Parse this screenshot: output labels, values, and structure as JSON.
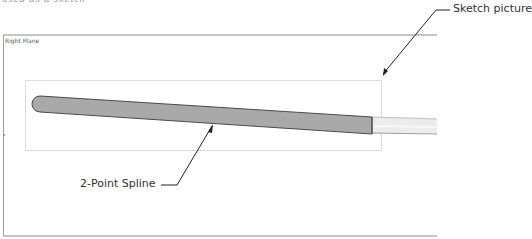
{
  "header": {
    "partial_text": "used as a sketch"
  },
  "viewport": {
    "plane_label": "Right Plane"
  },
  "callouts": {
    "sketch_picture": "Sketch picture",
    "spline": "2-Point Spline"
  },
  "colors": {
    "frame_line": "#8a8a8a",
    "picture_border": "#d8d8d8",
    "spline_fill": "#a8a8a8",
    "spline_stroke": "#555555",
    "rod_light": "#e6e6e6",
    "leader": "#222222"
  }
}
